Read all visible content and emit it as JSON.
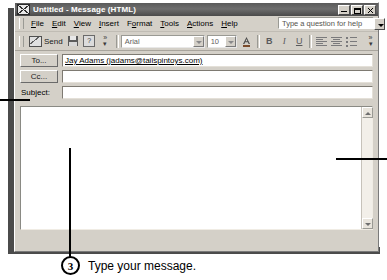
{
  "window": {
    "title": "Untitled - Message (HTML)",
    "app_icon": "envelope-icon",
    "controls": {
      "minimize": "Minimize",
      "maximize": "Maximize",
      "close": "Close"
    }
  },
  "menubar": {
    "items": [
      {
        "label": "File"
      },
      {
        "label": "Edit"
      },
      {
        "label": "View"
      },
      {
        "label": "Insert"
      },
      {
        "label": "Format"
      },
      {
        "label": "Tools"
      },
      {
        "label": "Actions"
      },
      {
        "label": "Help"
      }
    ],
    "ask_box": {
      "placeholder": "Type a question for help",
      "value": "Type a question for help"
    }
  },
  "toolbar": {
    "send_label": "Send",
    "save_title": "Save",
    "help_title": "Help",
    "more_buttons_title": "More Buttons",
    "font_name": "Arial",
    "font_size": "10",
    "font_color_title": "Font Color",
    "bold_label": "B",
    "italic_label": "I",
    "underline_label": "U",
    "align_left_title": "Align Left",
    "align_center_title": "Center",
    "bullets_title": "Bullets",
    "overflow_title": "Toolbar Options"
  },
  "fields": {
    "to_button": "To...",
    "to_value": "Jay Adams (jadams@tailspintoys.com)",
    "cc_button": "Cc...",
    "cc_value": "",
    "subject_label": "Subject:",
    "subject_value": ""
  },
  "body": {
    "value": "",
    "scroll_up_title": "Scroll Up",
    "scroll_down_title": "Scroll Down"
  },
  "callouts": [
    {
      "number": "3",
      "text": "Type your message."
    }
  ],
  "colors": {
    "titlebar": "#5a5a5a",
    "window_face": "#d4d0c8",
    "field_bg": "#ffffff",
    "leader_line": "#000000"
  }
}
